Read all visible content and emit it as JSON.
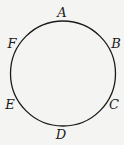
{
  "diagram": {
    "type": "circle-with-labeled-points",
    "circle": {
      "cx": 63,
      "cy": 73.5,
      "r": 52.5,
      "stroke": "#1a1a1a"
    },
    "points": [
      {
        "label": "A",
        "x": 62,
        "y": 17
      },
      {
        "label": "B",
        "x": 116,
        "y": 48
      },
      {
        "label": "C",
        "x": 114,
        "y": 109
      },
      {
        "label": "D",
        "x": 61,
        "y": 139
      },
      {
        "label": "E",
        "x": 10,
        "y": 109
      },
      {
        "label": "F",
        "x": 12,
        "y": 48
      }
    ]
  }
}
